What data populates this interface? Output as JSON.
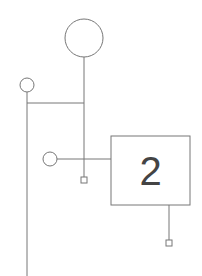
{
  "diagram": {
    "type": "line-node-diagram",
    "stroke_color": "#777777",
    "background": "#ffffff",
    "box": {
      "label": "2"
    },
    "nodes": [
      {
        "id": "large-circle",
        "shape": "circle",
        "cx": 84,
        "cy": 38,
        "r": 19
      },
      {
        "id": "small-circle-top",
        "shape": "circle",
        "cx": 27,
        "cy": 85,
        "r": 7
      },
      {
        "id": "small-circle-mid",
        "shape": "circle",
        "cx": 50,
        "cy": 159,
        "r": 7
      },
      {
        "id": "box-2",
        "shape": "rect",
        "x": 111,
        "y": 136,
        "w": 79,
        "h": 69
      },
      {
        "id": "terminal-a",
        "shape": "square",
        "cx": 84,
        "cy": 180,
        "size": 6
      },
      {
        "id": "terminal-b",
        "shape": "square",
        "cx": 169,
        "cy": 243,
        "size": 6
      }
    ]
  }
}
